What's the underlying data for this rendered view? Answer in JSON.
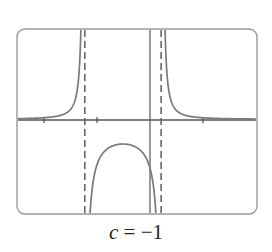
{
  "chart_data": {
    "type": "line",
    "title": "",
    "caption": {
      "variable": "c",
      "equals": " = ",
      "value": "−1"
    },
    "xlabel": "",
    "ylabel": "",
    "grid": false,
    "legend": null,
    "axes": {
      "x_ticks": [
        -2,
        -1,
        1
      ],
      "x_axis_visible": true,
      "y_axis_visible": true
    },
    "vertical_asymptotes": [
      -1.23,
      0.21
    ],
    "series": [
      {
        "name": "f(x)",
        "description": "rational function with two vertical asymptotes; positive outer branches decaying toward the x-axis, negative inner arch peaking near x=-0.5",
        "sample_points": [
          {
            "x": -2.5,
            "y": 0.06
          },
          {
            "x": -2.0,
            "y": 0.1
          },
          {
            "x": -1.5,
            "y": 0.35
          },
          {
            "x": -1.3,
            "y": 1.5
          },
          {
            "x": -1.1,
            "y": -1.3
          },
          {
            "x": -0.5,
            "y": -0.45
          },
          {
            "x": 0.0,
            "y": -1.0
          },
          {
            "x": 0.15,
            "y": -3.0
          },
          {
            "x": 0.3,
            "y": 1.7
          },
          {
            "x": 0.5,
            "y": 0.5
          },
          {
            "x": 1.0,
            "y": 0.17
          },
          {
            "x": 2.0,
            "y": 0.06
          }
        ]
      }
    ],
    "colors": {
      "curve": "#7a7a7a",
      "axes": "#555555",
      "frame": "#9a9a9a",
      "asymptote": "#666666"
    }
  }
}
